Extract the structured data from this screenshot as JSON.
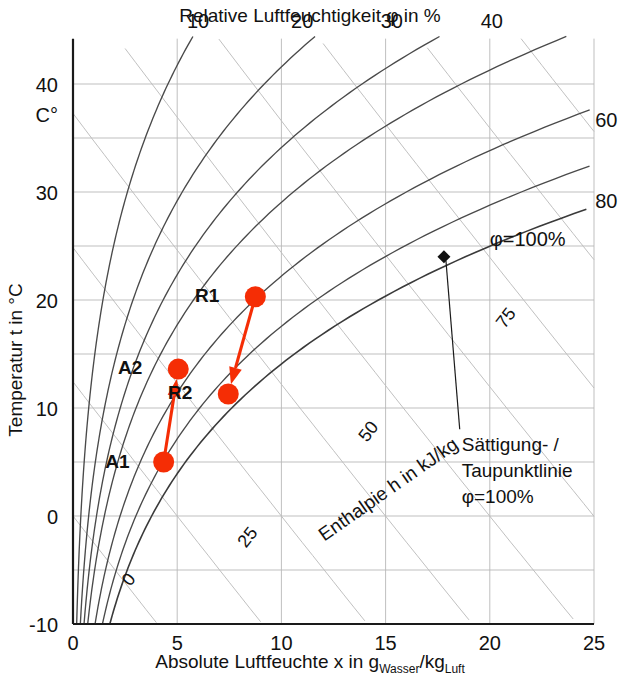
{
  "chart_data": {
    "type": "line",
    "title": "Relative Luftfeuchtigkeit φ in %",
    "xlabel": "Absolute Luftfeuchte x in g_Wasser/kg_Luft",
    "ylabel": "Temperatur t in °C",
    "xlim": [
      0,
      25
    ],
    "ylim": [
      -10,
      44
    ],
    "x_ticks": [
      "0",
      "5",
      "10",
      "15",
      "20",
      "25"
    ],
    "x_tick_values": [
      0,
      5,
      10,
      15,
      20,
      25
    ],
    "y_ticks": [
      "40",
      "30",
      "20",
      "10",
      "0",
      "-10"
    ],
    "y_tick_values": [
      40,
      30,
      20,
      10,
      0,
      -10
    ],
    "y_minor_values": [
      35,
      25,
      15,
      5,
      -5
    ],
    "y_unit_note": "C°",
    "grid": true,
    "legend": "none",
    "rh_curves": [
      {
        "label": "10",
        "phi": 10,
        "label_x": 6.0,
        "label_y": 45.2
      },
      {
        "label": "20",
        "phi": 20,
        "label_x": 11.0,
        "label_y": 45.2
      },
      {
        "label": "30",
        "phi": 30,
        "label_x": 15.3,
        "label_y": 45.2
      },
      {
        "label": "40",
        "phi": 40,
        "label_x": 20.1,
        "label_y": 45.2
      },
      {
        "label": "60",
        "phi": 60,
        "label_x": 24.3,
        "label_y": 36.0
      },
      {
        "label": "80",
        "phi": 80,
        "label_x": 24.3,
        "label_y": 28.5
      },
      {
        "label": "φ=100%",
        "phi": 100,
        "label_x": 20.0,
        "label_y": 25.0
      }
    ],
    "enthalpy_lines": [
      {
        "label": "0",
        "value": 0,
        "label_x": 2.9,
        "label_y": -6.2
      },
      {
        "label": "25",
        "value": 25,
        "label_x": 8.6,
        "label_y": -2.3
      },
      {
        "label": "50",
        "value": 50,
        "label_x": 14.4,
        "label_y": 7.5
      },
      {
        "label": "75",
        "value": 75,
        "label_x": 21.0,
        "label_y": 18.0
      }
    ],
    "enthalpy_axis_label": "Enthalpie h in kJ/kg",
    "points": [
      {
        "name": "A1",
        "x": 4.35,
        "t": 5.0,
        "label": "A1",
        "label_dx": -34,
        "label_dy": 6
      },
      {
        "name": "A2",
        "x": 5.05,
        "t": 13.6,
        "label": "A2",
        "label_dx": -36,
        "label_dy": 5
      },
      {
        "name": "R1",
        "x": 8.75,
        "t": 20.3,
        "label": "R1",
        "label_dx": -36,
        "label_dy": 5
      },
      {
        "name": "R2",
        "x": 7.45,
        "t": 11.3,
        "label": "R2",
        "label_dx": -36,
        "label_dy": 5
      }
    ],
    "process_arrows": [
      {
        "from": "A1",
        "to": "A2",
        "name": "arrow-a1-a2"
      },
      {
        "from": "R1",
        "to": "R2",
        "name": "arrow-r1-r2"
      }
    ],
    "dew_marker": {
      "x": 17.8,
      "t": 24.0,
      "name": "dew-point-marker"
    },
    "annotation": {
      "line1": "Sättigung- /",
      "line2": "Taupunktlinie",
      "line3": "φ=100%",
      "anchor_x": 19.9,
      "anchor_y": 6.0
    },
    "saturation_label": "φ=100%"
  },
  "xlabel_parts": {
    "main1": "Absolute Luftfeuchte x in g",
    "sub1": "Wasser",
    "main2": "/kg",
    "sub2": "Luft"
  }
}
